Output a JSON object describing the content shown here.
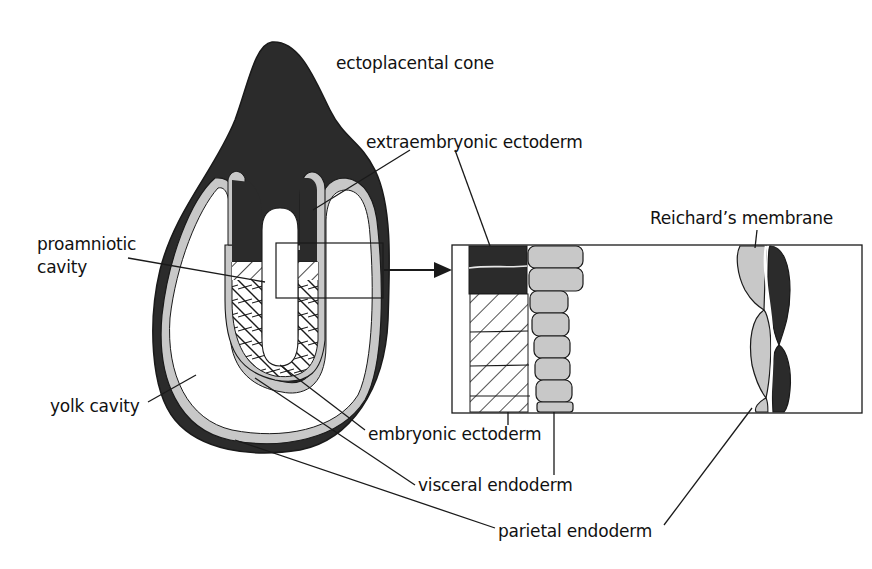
{
  "figure": {
    "colors": {
      "dark_tissue": "#2b2b2b",
      "light_tissue": "#c8c8c8",
      "outline": "#1a1a1a",
      "background": "#ffffff"
    },
    "labels": {
      "ectoplacental_cone": "ectoplacental cone",
      "extraembryonic_ectoderm": "extraembryonic ectoderm",
      "proamniotic_cavity_line1": "proamniotic",
      "proamniotic_cavity_line2": "cavity",
      "reichards_membrane": "Reichard’s membrane",
      "yolk_cavity": "yolk cavity",
      "embryonic_ectoderm": "embryonic ectoderm",
      "visceral_endoderm": "visceral endoderm",
      "parietal_endoderm": "parietal endoderm"
    },
    "inset": {
      "description": "Magnified view of boxed region",
      "layers": [
        "extraembryonic ectoderm (dark)",
        "embryonic ectoderm (hatched)",
        "visceral endoderm (light cells)",
        "parietal endoderm (light cells)",
        "Reichard’s membrane (white line)",
        "trophectoderm (dark cells)"
      ]
    }
  }
}
